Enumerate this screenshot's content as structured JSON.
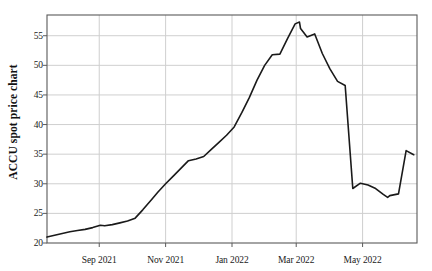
{
  "chart_data": {
    "type": "line",
    "title": "",
    "xlabel": "",
    "ylabel": "ACCU spot price chart",
    "ylim": [
      20,
      58.5
    ],
    "xlim": [
      "2021-07-15",
      "2022-06-20"
    ],
    "grid": true,
    "legend": false,
    "legend_position": "none",
    "line_color": "#1a1a1a",
    "grid_color": "#cfcfcf",
    "axis_color": "#5a5a5a",
    "background": "#ffffff",
    "yticks": [
      20,
      25,
      30,
      35,
      40,
      45,
      50,
      55
    ],
    "ytick_labels": [
      "20",
      "25",
      "30",
      "35",
      "40",
      "45",
      "50",
      "55"
    ],
    "xticks": [
      "2021-09-01",
      "2021-11-01",
      "2022-01-01",
      "2022-03-01",
      "2022-05-01"
    ],
    "xtick_labels": [
      "Sep 2021",
      "Nov 2021",
      "Jan 2022",
      "Mar 2022",
      "May 2022"
    ],
    "series": [
      {
        "name": "ACCU spot price",
        "units": "AUD",
        "x": [
          "2021-07-15",
          "2021-07-22",
          "2021-07-29",
          "2021-08-05",
          "2021-08-12",
          "2021-08-19",
          "2021-08-26",
          "2021-09-02",
          "2021-09-06",
          "2021-09-13",
          "2021-09-20",
          "2021-09-27",
          "2021-10-04",
          "2021-10-11",
          "2021-10-18",
          "2021-10-25",
          "2021-11-01",
          "2021-11-08",
          "2021-11-15",
          "2021-11-22",
          "2021-11-29",
          "2021-12-06",
          "2021-12-13",
          "2021-12-20",
          "2021-12-27",
          "2022-01-03",
          "2022-01-10",
          "2022-01-17",
          "2022-01-24",
          "2022-01-31",
          "2022-02-07",
          "2022-02-14",
          "2022-02-21",
          "2022-02-28",
          "2022-03-04",
          "2022-03-05",
          "2022-03-11",
          "2022-03-18",
          "2022-03-25",
          "2022-04-01",
          "2022-04-08",
          "2022-04-15",
          "2022-04-22",
          "2022-04-29",
          "2022-05-06",
          "2022-05-13",
          "2022-05-20",
          "2022-05-24",
          "2022-05-26",
          "2022-06-03",
          "2022-06-10",
          "2022-06-17"
        ],
        "y": [
          21.0,
          21.3,
          21.6,
          21.9,
          22.1,
          22.3,
          22.6,
          23.0,
          22.9,
          23.1,
          23.4,
          23.7,
          24.2,
          25.6,
          27.1,
          28.6,
          30.0,
          31.3,
          32.6,
          33.9,
          34.2,
          34.6,
          35.8,
          37.0,
          38.2,
          39.6,
          42.0,
          44.6,
          47.5,
          50.0,
          51.8,
          51.9,
          54.5,
          57.0,
          57.3,
          56.2,
          54.8,
          55.3,
          52.0,
          49.4,
          47.3,
          46.6,
          29.2,
          30.1,
          29.8,
          29.2,
          28.2,
          27.7,
          28.0,
          28.3,
          35.6,
          34.9
        ],
        "min": 21.0,
        "max": 57.3,
        "start_value": 21.0,
        "end_value": 34.9,
        "crash_date": "2022-03-04",
        "crash_from": 46.6,
        "crash_to": 29.2
      }
    ]
  }
}
